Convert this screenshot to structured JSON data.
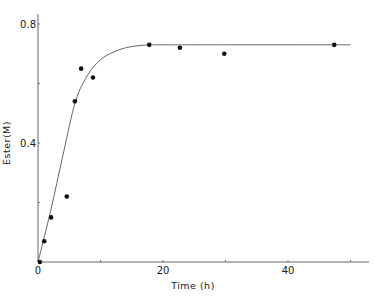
{
  "chart_data": {
    "type": "scatter",
    "title": "",
    "xlabel": "Time (h)",
    "ylabel": "Ester(M)",
    "xlim": [
      0,
      50
    ],
    "ylim": [
      0,
      0.8
    ],
    "xticks": [
      0,
      20,
      40
    ],
    "xtick_labels": [
      "0",
      "20",
      "40"
    ],
    "yticks": [
      0,
      0.4,
      0.8
    ],
    "ytick_labels": [
      "0",
      "0.4",
      "0.8"
    ],
    "grid": false,
    "legend": null,
    "series": [
      {
        "name": "measured",
        "kind": "scatter",
        "x": [
          0.3,
          1.0,
          2.1,
          4.6,
          5.9,
          6.9,
          8.8,
          17.8,
          22.7,
          29.8,
          47.4
        ],
        "y": [
          0.0,
          0.07,
          0.15,
          0.22,
          0.54,
          0.65,
          0.62,
          0.73,
          0.72,
          0.7,
          0.73
        ]
      },
      {
        "name": "fitted curve",
        "kind": "line",
        "x": [
          0,
          2,
          4,
          6,
          8,
          10,
          12,
          14,
          16,
          18,
          20,
          30,
          40,
          50
        ],
        "y": [
          0,
          0.17,
          0.36,
          0.54,
          0.63,
          0.68,
          0.705,
          0.72,
          0.727,
          0.73,
          0.73,
          0.73,
          0.73,
          0.73
        ]
      }
    ]
  },
  "colors": {
    "axis": "#555555",
    "points": "#111111",
    "curve": "#666666"
  }
}
